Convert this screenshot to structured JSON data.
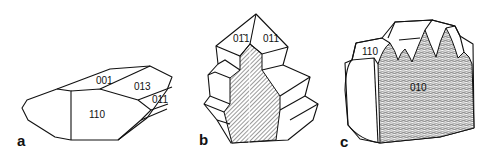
{
  "figure": {
    "panels": [
      {
        "id": "a",
        "label": "a",
        "faces": [
          "001",
          "013",
          "011",
          "110"
        ]
      },
      {
        "id": "b",
        "label": "b",
        "faces": [
          "01̄1",
          "011"
        ]
      },
      {
        "id": "c",
        "label": "c",
        "faces": [
          "110",
          "010"
        ]
      }
    ]
  }
}
